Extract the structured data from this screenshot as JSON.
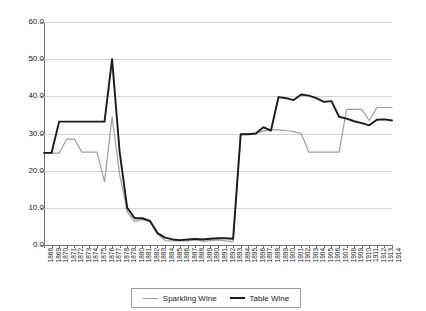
{
  "chart_data": {
    "type": "line",
    "title": "",
    "xlabel": "",
    "ylabel": "",
    "ylim": [
      0.0,
      60.0
    ],
    "yticks": [
      "0.0",
      "10.0",
      "20.0",
      "30.0",
      "40.0",
      "50.0",
      "60.0"
    ],
    "grid": true,
    "legend_position": "bottom",
    "categories": [
      "1868",
      "1869",
      "1870",
      "1871",
      "1872",
      "1873",
      "1874",
      "1875",
      "1876",
      "1877",
      "1878",
      "1879",
      "1880",
      "1881",
      "1882",
      "1883",
      "1884",
      "1885",
      "1886",
      "1887",
      "1888",
      "1889",
      "1890",
      "1891",
      "1892",
      "1893",
      "1894",
      "1895",
      "1896",
      "1897",
      "1898",
      "1899",
      "1900",
      "1901",
      "1902",
      "1903",
      "1904",
      "1905",
      "1906",
      "1907",
      "1908",
      "1909",
      "1910",
      "1911",
      "1912",
      "1913",
      "1914"
    ],
    "series": [
      {
        "name": "Sparkling Wine",
        "color": "#9e9e9e",
        "values": [
          24.8,
          24.7,
          24.7,
          28.5,
          28.5,
          25.0,
          25.0,
          25.0,
          17.0,
          34.5,
          19.0,
          9.0,
          6.3,
          6.9,
          6.2,
          3.0,
          1.2,
          1.1,
          1.1,
          1.1,
          1.5,
          1.0,
          1.2,
          1.4,
          1.1,
          0.9,
          29.8,
          29.8,
          30.0,
          30.7,
          31.0,
          31.0,
          30.8,
          30.5,
          30.0,
          25.0,
          25.0,
          25.0,
          25.0,
          25.0,
          36.5,
          36.5,
          36.5,
          33.5,
          37.0,
          37.0,
          37.0
        ]
      },
      {
        "name": "Table Wine",
        "color": "#1a1a1a",
        "values": [
          24.8,
          24.8,
          33.2,
          33.2,
          33.2,
          33.2,
          33.2,
          33.2,
          33.2,
          50.0,
          25.0,
          10.0,
          7.2,
          7.2,
          6.5,
          3.2,
          2.0,
          1.5,
          1.3,
          1.5,
          1.6,
          1.5,
          1.7,
          1.8,
          1.8,
          1.7,
          29.8,
          29.8,
          30.0,
          31.7,
          30.8,
          39.8,
          39.5,
          39.0,
          40.5,
          40.2,
          39.5,
          38.5,
          38.7,
          34.5,
          34.0,
          33.3,
          32.8,
          32.2,
          33.7,
          33.8,
          33.5
        ]
      }
    ]
  },
  "legend": {
    "items": [
      {
        "label": "Sparkling Wine"
      },
      {
        "label": "Table Wine"
      }
    ]
  }
}
